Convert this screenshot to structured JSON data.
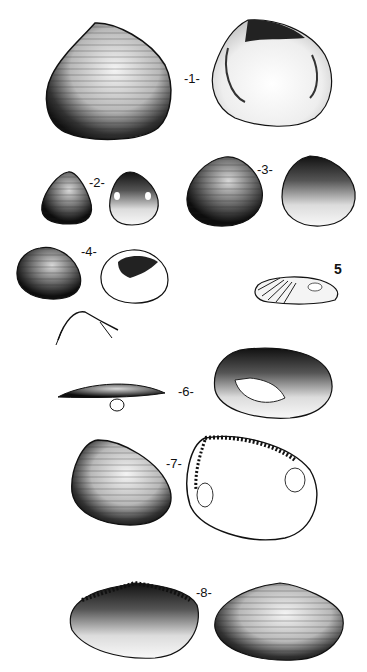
{
  "plate": {
    "background": "#ffffff",
    "ink": "#111111",
    "figures": [
      {
        "number": "1",
        "label": "-1-"
      },
      {
        "number": "2",
        "label": "-2-"
      },
      {
        "number": "3",
        "label": "-3-"
      },
      {
        "number": "4",
        "label": "-4-"
      },
      {
        "number": "5",
        "label": "5"
      },
      {
        "number": "6",
        "label": "-6-"
      },
      {
        "number": "7",
        "label": "-7-"
      },
      {
        "number": "8",
        "label": "-8-"
      }
    ]
  }
}
